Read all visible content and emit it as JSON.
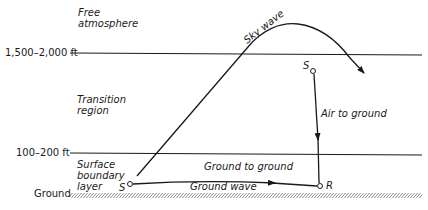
{
  "layers": {
    "free_atmosphere": "Free\natmosphere",
    "free_line1": "Free",
    "free_line2": "atmosphere",
    "transition_line1": "Transition",
    "transition_line2": "region",
    "surface_line1": "Surface",
    "surface_line2": "boundary",
    "surface_line3": "layer"
  },
  "heights": {
    "upper": "1,500–2,000 ft",
    "lower": "100–200 ft",
    "ground": "Ground"
  },
  "paths": {
    "sky_wave": "Sky wave",
    "air_to_ground": "Air to ground",
    "ground_to_ground": "Ground to ground",
    "ground_wave": "Ground wave"
  },
  "points": {
    "source_ground": "S",
    "source_air": "S",
    "receiver": "R"
  },
  "colors": {
    "ink": "#1a1a1a",
    "background": "#ffffff"
  }
}
